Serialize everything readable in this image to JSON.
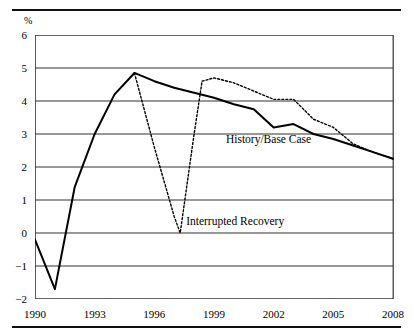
{
  "figure": {
    "unit_label": "%",
    "top_rule": "horizontal-rule",
    "bottom_rule": "horizontal-rule"
  },
  "chart_data": {
    "type": "line",
    "title": "",
    "subtitle": "",
    "xlabel": "",
    "ylabel": "%",
    "xlim": [
      1990,
      2008
    ],
    "ylim": [
      -2,
      6
    ],
    "grid": true,
    "grid_axis": "y",
    "legend": "inline-annotations",
    "y_ticks": [
      6,
      5,
      4,
      3,
      2,
      1,
      0,
      -1,
      -2
    ],
    "y_tick_labels": [
      "6",
      "5",
      "4",
      "3",
      "2",
      "1",
      "0",
      "−1",
      "−2"
    ],
    "x_ticks": [
      1990,
      1991,
      1992,
      1993,
      1994,
      1995,
      1996,
      1997,
      1998,
      1999,
      2000,
      2001,
      2002,
      2003,
      2004,
      2005,
      2006,
      2007,
      2008
    ],
    "x_tick_labels_shown": [
      "1990",
      "1993",
      "1996",
      "1999",
      "2002",
      "2005",
      "2008"
    ],
    "x_label_years": [
      1990,
      1993,
      1996,
      1999,
      2002,
      2005,
      2008
    ],
    "series": [
      {
        "name": "History/Base Case",
        "style": "solid",
        "color": "#000000",
        "annotation": "History/Base Case",
        "x": [
          1990,
          1991,
          1992,
          1993,
          1994,
          1995,
          1996,
          1997,
          1998,
          1999,
          2000,
          2001,
          2002,
          2003,
          2004,
          2005,
          2006,
          2007,
          2008
        ],
        "values": [
          -0.2,
          -1.7,
          1.4,
          3.0,
          4.2,
          4.85,
          4.6,
          4.4,
          4.25,
          4.1,
          3.9,
          3.75,
          3.2,
          3.3,
          3.0,
          2.85,
          2.65,
          2.45,
          2.25
        ]
      },
      {
        "name": "Interrupted Recovery",
        "style": "dotted",
        "color": "#000000",
        "annotation": "Interrupted Recovery",
        "x": [
          1995,
          1996,
          1997,
          1997.3,
          1998,
          1998.4,
          1999,
          2000,
          2001,
          2002,
          2003,
          2004,
          2005,
          2006,
          2007,
          2008
        ],
        "values": [
          4.85,
          2.6,
          0.5,
          0.0,
          3.0,
          4.6,
          4.7,
          4.55,
          4.3,
          4.05,
          4.05,
          3.45,
          3.2,
          2.7,
          2.45,
          2.25
        ]
      }
    ],
    "annotations": [
      {
        "text": "History/Base Case",
        "x": 1999.6,
        "y": 2.85
      },
      {
        "text": "Interrupted Recovery",
        "x": 1997.6,
        "y": 0.35
      }
    ]
  }
}
